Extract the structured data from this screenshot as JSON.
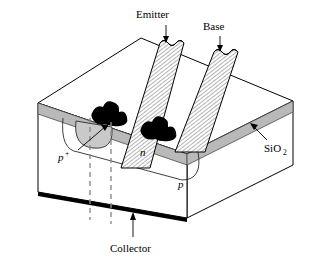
{
  "figure": {
    "kind": "bipolar-junction-transistor-cross-section",
    "title": "",
    "labels": {
      "emitter": "Emitter",
      "base": "Base",
      "collector": "Collector",
      "oxide": "SiO",
      "oxide_sub": "2",
      "region_pplus": "p",
      "region_pplus_sup": "+",
      "region_n": "n",
      "region_p": "p"
    },
    "colors": {
      "outline": "#000000",
      "body_fill": "#ffffff",
      "oxide_fill": "#b9b9b9",
      "oxide_edge": "#6e6e6e",
      "metal_fill": "#ffffff",
      "metal_hatch": "#000000",
      "contact_fill": "#000000",
      "pplus_fill": "#c9c9c9",
      "collector_bar": "#000000",
      "dashed": "#8c8c8c"
    }
  }
}
